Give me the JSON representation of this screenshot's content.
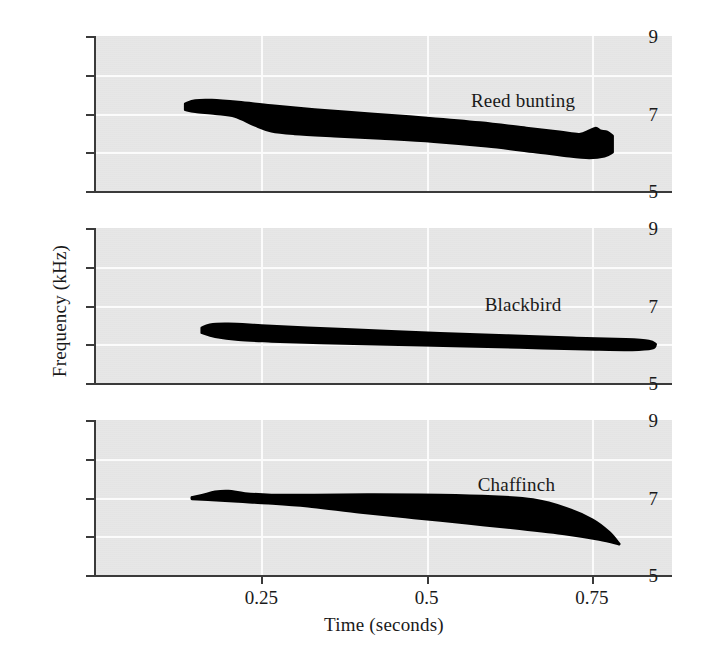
{
  "chart_data": {
    "type": "line",
    "title": "",
    "xlabel": "Time (seconds)",
    "ylabel": "Frequency (kHz)",
    "xlim": [
      0.0,
      0.87
    ],
    "ylim": [
      5,
      9
    ],
    "xticks": [
      0.25,
      0.5,
      0.75
    ],
    "xticklabels": [
      "0.25",
      "0.5",
      "0.75"
    ],
    "yticks": [
      5,
      6,
      7,
      8,
      9
    ],
    "yticklabels": [
      "5",
      "",
      "7",
      "",
      "9"
    ],
    "grid": true,
    "legend": "none",
    "panel_background": "#e7e7e7",
    "gridline_color": "#fbfbfb",
    "trace_color": "#000000",
    "axis_color": "#3a3a3a",
    "panels": [
      {
        "label": "Reed bunting",
        "label_x": 0.645,
        "label_y": 7.35,
        "description": "Broad descending band; begins ~0.135 s at 7.3 kHz, sweeps slowly down to ~6.0 kHz by 0.74 s, ends with small notched hook at ~0.78 s",
        "upper_envelope": [
          [
            0.135,
            7.25
          ],
          [
            0.15,
            7.33
          ],
          [
            0.175,
            7.34
          ],
          [
            0.215,
            7.29
          ],
          [
            0.265,
            7.2
          ],
          [
            0.33,
            7.1
          ],
          [
            0.42,
            6.98
          ],
          [
            0.5,
            6.88
          ],
          [
            0.58,
            6.76
          ],
          [
            0.65,
            6.62
          ],
          [
            0.7,
            6.52
          ],
          [
            0.73,
            6.46
          ],
          [
            0.745,
            6.55
          ],
          [
            0.755,
            6.62
          ],
          [
            0.762,
            6.55
          ],
          [
            0.772,
            6.52
          ],
          [
            0.78,
            6.42
          ]
        ],
        "lower_envelope": [
          [
            0.135,
            7.1
          ],
          [
            0.15,
            7.05
          ],
          [
            0.18,
            7.0
          ],
          [
            0.21,
            6.93
          ],
          [
            0.24,
            6.7
          ],
          [
            0.265,
            6.55
          ],
          [
            0.3,
            6.48
          ],
          [
            0.36,
            6.42
          ],
          [
            0.43,
            6.36
          ],
          [
            0.51,
            6.28
          ],
          [
            0.59,
            6.16
          ],
          [
            0.66,
            6.02
          ],
          [
            0.715,
            5.9
          ],
          [
            0.745,
            5.86
          ],
          [
            0.768,
            5.9
          ],
          [
            0.78,
            6.0
          ]
        ]
      },
      {
        "label": "Blackbird",
        "label_x": 0.645,
        "label_y": 7.05,
        "description": "Narrow slowly descending band; begins ~0.160 s at 6.5 kHz, descends gently to ~6.0 kHz, tapers to rounded tip at ~0.845 s",
        "upper_envelope": [
          [
            0.16,
            6.42
          ],
          [
            0.172,
            6.5
          ],
          [
            0.2,
            6.52
          ],
          [
            0.25,
            6.48
          ],
          [
            0.32,
            6.42
          ],
          [
            0.42,
            6.35
          ],
          [
            0.52,
            6.28
          ],
          [
            0.62,
            6.22
          ],
          [
            0.72,
            6.16
          ],
          [
            0.8,
            6.12
          ],
          [
            0.835,
            6.08
          ],
          [
            0.845,
            6.0
          ]
        ],
        "lower_envelope": [
          [
            0.16,
            6.3
          ],
          [
            0.18,
            6.2
          ],
          [
            0.215,
            6.12
          ],
          [
            0.265,
            6.08
          ],
          [
            0.34,
            6.04
          ],
          [
            0.44,
            6.0
          ],
          [
            0.54,
            5.96
          ],
          [
            0.64,
            5.92
          ],
          [
            0.74,
            5.88
          ],
          [
            0.81,
            5.86
          ],
          [
            0.84,
            5.9
          ],
          [
            0.845,
            6.0
          ]
        ]
      },
      {
        "label": "Chaffinch",
        "label_x": 0.635,
        "label_y": 7.35,
        "description": "Band starting ~0.145 s at 7.0 kHz with slight rise to 7.15 kHz, flat top near 7.05 kHz, lower edge falls steeply; terminates in sharp downward point at ~0.79 s reaching 5.8 kHz",
        "upper_envelope": [
          [
            0.145,
            7.0
          ],
          [
            0.16,
            7.05
          ],
          [
            0.18,
            7.14
          ],
          [
            0.2,
            7.16
          ],
          [
            0.225,
            7.1
          ],
          [
            0.265,
            7.06
          ],
          [
            0.33,
            7.06
          ],
          [
            0.42,
            7.07
          ],
          [
            0.52,
            7.06
          ],
          [
            0.6,
            7.02
          ],
          [
            0.66,
            6.94
          ],
          [
            0.71,
            6.72
          ],
          [
            0.75,
            6.42
          ],
          [
            0.775,
            6.1
          ],
          [
            0.79,
            5.8
          ]
        ],
        "lower_envelope": [
          [
            0.145,
            6.97
          ],
          [
            0.175,
            6.94
          ],
          [
            0.215,
            6.9
          ],
          [
            0.26,
            6.86
          ],
          [
            0.32,
            6.78
          ],
          [
            0.4,
            6.62
          ],
          [
            0.48,
            6.48
          ],
          [
            0.56,
            6.34
          ],
          [
            0.64,
            6.2
          ],
          [
            0.71,
            6.06
          ],
          [
            0.76,
            5.92
          ],
          [
            0.79,
            5.8
          ]
        ]
      }
    ]
  }
}
